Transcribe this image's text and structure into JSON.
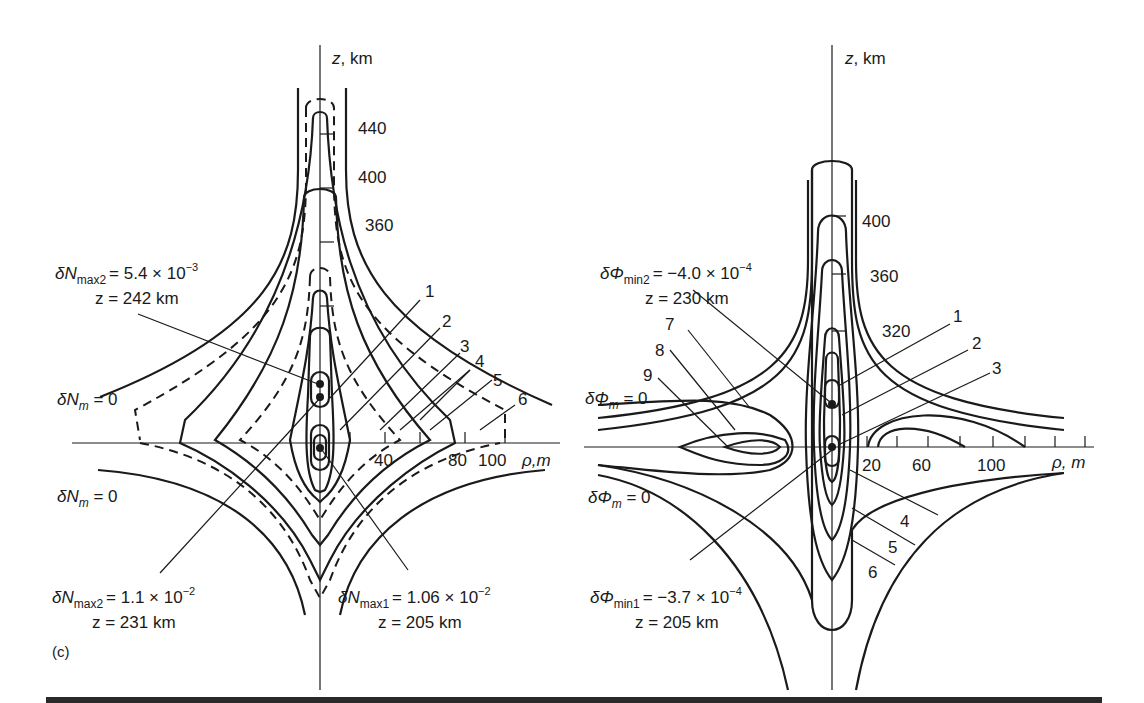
{
  "figure_label": "(c)",
  "left_panel": {
    "name": "electron-density-perturbation",
    "z_axis_label": "z, km",
    "rho_axis_label": "ρ,m",
    "z_ticks": [
      "440",
      "400",
      "360"
    ],
    "rho_ticks": [
      "40",
      "80",
      "100"
    ],
    "zero_labels": [
      "δN_m = 0",
      "δN_m = 0"
    ],
    "contour_labels": [
      "1",
      "2",
      "3",
      "4",
      "5",
      "6"
    ],
    "annotations": [
      {
        "quantity": "δN",
        "sub": "max2",
        "value": "= 5.4 × 10",
        "exp": "−3",
        "z": "z = 242 km"
      },
      {
        "quantity": "δN",
        "sub": "max2",
        "value": "= 1.1 × 10",
        "exp": "−2",
        "z": "z = 231 km"
      },
      {
        "quantity": "δN",
        "sub": "max1",
        "value": "= 1.06 × 10",
        "exp": "−2",
        "z": "z = 205 km"
      }
    ],
    "zero_label_text": {
      "prefix": "δN",
      "sub": "m",
      "suffix": " = 0"
    }
  },
  "right_panel": {
    "name": "potential-perturbation",
    "z_axis_label": "z, km",
    "rho_axis_label": "ρ, m",
    "z_ticks": [
      "400",
      "360",
      "320"
    ],
    "rho_ticks": [
      "20",
      "60",
      "100"
    ],
    "contour_labels": [
      "1",
      "2",
      "3",
      "4",
      "5",
      "6",
      "7",
      "8",
      "9"
    ],
    "annotations": [
      {
        "quantity": "δΦ",
        "sub": "min2",
        "value": "= −4.0 × 10",
        "exp": "−4",
        "z": "z = 230 km"
      },
      {
        "quantity": "δΦ",
        "sub": "min1",
        "value": "= −3.7 × 10",
        "exp": "−4",
        "z": "z = 205 km"
      }
    ],
    "zero_label_text": {
      "prefix": "δΦ",
      "sub": "m",
      "suffix": " = 0"
    }
  }
}
